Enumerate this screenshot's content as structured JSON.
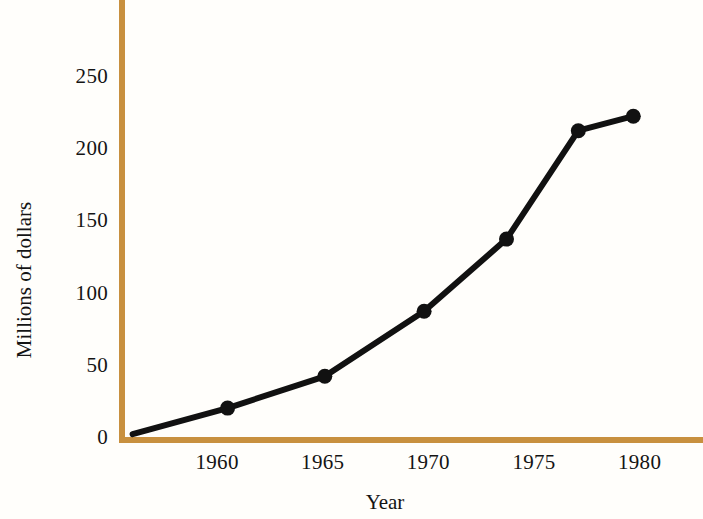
{
  "chart_data": {
    "type": "line",
    "title": "",
    "subtitle": "",
    "xlabel": "Year",
    "ylabel": "Millions of dollars",
    "xlim": [
      1955.5,
      1983.0
    ],
    "ylim": [
      0,
      272
    ],
    "grid": false,
    "legend": null,
    "marker": "filled-circle",
    "line_color": "#111111",
    "axis_color": "#c8903f",
    "x": [
      1960.5,
      1965.1,
      1969.8,
      1973.7,
      1977.1,
      1979.7
    ],
    "values": [
      20,
      42,
      87,
      137,
      212,
      222
    ],
    "series": [
      {
        "name": "Millions of dollars",
        "x": [
          1960.5,
          1965.1,
          1969.8,
          1973.7,
          1977.1,
          1979.7
        ],
        "values": [
          20,
          42,
          87,
          137,
          212,
          222
        ]
      }
    ],
    "line_start": {
      "x": 1956.0,
      "y": 2
    },
    "xticks": [
      1960,
      1965,
      1970,
      1975,
      1980
    ],
    "xtick_labels": [
      "1960",
      "1965",
      "1970",
      "1975",
      "1980"
    ],
    "yticks": [
      0,
      50,
      100,
      150,
      200,
      250
    ],
    "ytick_labels": [
      "0",
      "50",
      "100",
      "150",
      "200",
      "250"
    ],
    "annotations": []
  }
}
